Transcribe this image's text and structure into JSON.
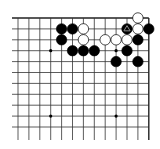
{
  "board": {
    "size": 19,
    "view": "top-right corner",
    "visible_columns": 13,
    "visible_rows": 11,
    "origin_px": {
      "x": 18,
      "y": 18
    },
    "spacing_px": 10.9,
    "edges": {
      "top": true,
      "right": true,
      "left": false,
      "bottom": false
    },
    "line_color": "#333333",
    "edge_color": "#222222",
    "background": "#ffffff",
    "hoshi": [
      {
        "col": 3,
        "row": 3
      },
      {
        "col": 9,
        "row": 3
      },
      {
        "col": 3,
        "row": 9
      },
      {
        "col": 9,
        "row": 9
      }
    ],
    "stones": [
      {
        "col": 11,
        "row": 0,
        "color": "white"
      },
      {
        "col": 4,
        "row": 1,
        "color": "black"
      },
      {
        "col": 5,
        "row": 1,
        "color": "black"
      },
      {
        "col": 6,
        "row": 1,
        "color": "white"
      },
      {
        "col": 10,
        "row": 1,
        "color": "black",
        "mark": "triangle"
      },
      {
        "col": 11,
        "row": 1,
        "color": "white"
      },
      {
        "col": 12,
        "row": 1,
        "color": "black"
      },
      {
        "col": 4,
        "row": 2,
        "color": "black"
      },
      {
        "col": 6,
        "row": 2,
        "color": "white"
      },
      {
        "col": 8,
        "row": 2,
        "color": "white"
      },
      {
        "col": 9,
        "row": 2,
        "color": "white"
      },
      {
        "col": 10,
        "row": 2,
        "color": "white"
      },
      {
        "col": 11,
        "row": 2,
        "color": "black"
      },
      {
        "col": 5,
        "row": 3,
        "color": "black"
      },
      {
        "col": 6,
        "row": 3,
        "color": "black"
      },
      {
        "col": 7,
        "row": 3,
        "color": "black"
      },
      {
        "col": 10,
        "row": 3,
        "color": "black"
      },
      {
        "col": 9,
        "row": 4,
        "color": "black"
      },
      {
        "col": 11,
        "row": 4,
        "color": "black"
      }
    ]
  }
}
